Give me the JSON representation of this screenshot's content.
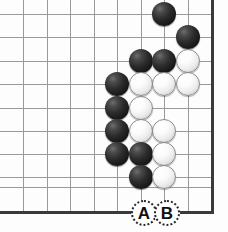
{
  "figure": {
    "board": {
      "width_px": 228,
      "height_px": 232,
      "grid_spacing_px": 23.4,
      "stone_radius_px": 12,
      "background_color": "#fdfdfd",
      "grid_color": "#9a9a9a",
      "edge_color": "#3a3a3a",
      "black_stone_color": "#161616",
      "white_stone_color": "#f5f5f5",
      "grid_x": [
        23,
        47,
        70,
        94,
        117,
        141,
        164,
        188
      ],
      "grid_y": [
        14,
        37,
        61,
        84,
        108,
        131,
        154,
        177,
        187
      ],
      "right_edge_x": 211,
      "bottom_edge_y": 211
    },
    "stones": [
      {
        "color": "black",
        "cx": 164,
        "cy": 14
      },
      {
        "color": "black",
        "cx": 188,
        "cy": 37
      },
      {
        "color": "black",
        "cx": 141,
        "cy": 61
      },
      {
        "color": "black",
        "cx": 164,
        "cy": 61
      },
      {
        "color": "white",
        "cx": 188,
        "cy": 61
      },
      {
        "color": "black",
        "cx": 117,
        "cy": 84
      },
      {
        "color": "white",
        "cx": 141,
        "cy": 84
      },
      {
        "color": "white",
        "cx": 164,
        "cy": 84
      },
      {
        "color": "white",
        "cx": 188,
        "cy": 84
      },
      {
        "color": "black",
        "cx": 117,
        "cy": 108
      },
      {
        "color": "white",
        "cx": 141,
        "cy": 108
      },
      {
        "color": "black",
        "cx": 117,
        "cy": 131
      },
      {
        "color": "white",
        "cx": 141,
        "cy": 131
      },
      {
        "color": "white",
        "cx": 164,
        "cy": 131
      },
      {
        "color": "black",
        "cx": 117,
        "cy": 154
      },
      {
        "color": "black",
        "cx": 141,
        "cy": 154
      },
      {
        "color": "white",
        "cx": 164,
        "cy": 154
      },
      {
        "color": "black",
        "cx": 141,
        "cy": 177
      },
      {
        "color": "white",
        "cx": 164,
        "cy": 177
      }
    ],
    "markers": [
      {
        "label": "A",
        "cx": 144,
        "cy": 213
      },
      {
        "label": "B",
        "cx": 167,
        "cy": 213
      }
    ]
  }
}
